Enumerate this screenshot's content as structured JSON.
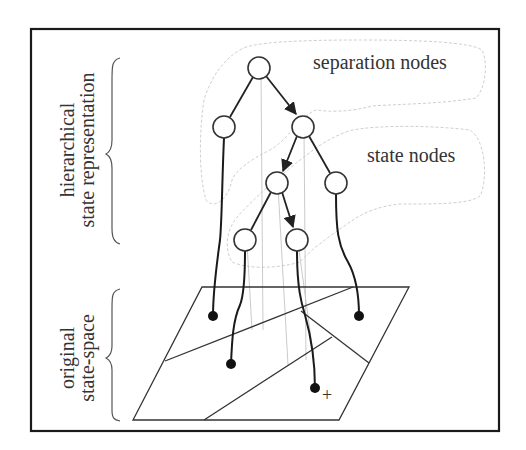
{
  "figure": {
    "side_labels": {
      "hierarchical": {
        "line1": "hierarchical",
        "line2": "state representation"
      },
      "original": {
        "line1": "original",
        "line2": "state-space"
      }
    },
    "callouts": {
      "separation": "separation nodes",
      "state": "state nodes"
    },
    "marker": "+"
  },
  "tree": {
    "nodes": [
      {
        "id": "root",
        "x": 259,
        "y": 68
      },
      {
        "id": "l2a",
        "x": 224,
        "y": 127
      },
      {
        "id": "l2b",
        "x": 303,
        "y": 127
      },
      {
        "id": "l3a",
        "x": 277,
        "y": 183
      },
      {
        "id": "l3b",
        "x": 336,
        "y": 183
      },
      {
        "id": "l4a",
        "x": 245,
        "y": 240
      },
      {
        "id": "l4b",
        "x": 297,
        "y": 240
      }
    ],
    "leaves": [
      {
        "id": "leaf1",
        "x": 213,
        "y": 316
      },
      {
        "id": "leaf2",
        "x": 231,
        "y": 364
      },
      {
        "id": "leaf3",
        "x": 359,
        "y": 316
      },
      {
        "id": "leaf4",
        "x": 315,
        "y": 388
      }
    ]
  },
  "colors": {
    "ink": "#222222",
    "faint": "#bbbbbb",
    "frame": "#1a1a1a"
  }
}
